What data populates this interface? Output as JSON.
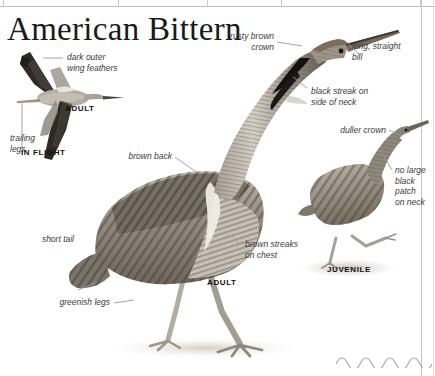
{
  "page": {
    "title": "American Bittern"
  },
  "figures": {
    "in_flight": {
      "caption_age": "ADULT",
      "caption_mode": "IN FLIGHT"
    },
    "adult": {
      "caption": "ADULT"
    },
    "juvenile": {
      "caption": "JUVENILE"
    }
  },
  "annotations": {
    "dark_outer_wing_feathers": "dark outer\nwing feathers",
    "trailing_legs": "trailing\nlegs",
    "rusty_brown_crown": "rusty brown\ncrown",
    "long_straight_bill": "long, straight\nbill",
    "black_streak_on_side_of_neck": "black streak on\nside of neck",
    "duller_crown": "duller crown",
    "no_large_black_patch_on_neck": "no large\nblack\npatch\non neck",
    "brown_back": "brown back",
    "short_tail": "short tail",
    "greenish_legs": "greenish legs",
    "brown_streaks_on_chest": "brown streaks\non chest"
  },
  "colors": {
    "ink": "#1a1a1a",
    "label": "#3b3b3b",
    "leader": "#9a9a9a",
    "rule": "#bdbdbd",
    "plumage_dark": "#3a342e",
    "plumage_mid": "#8d867c",
    "plumage_light": "#cfc9c0",
    "background": "#ffffff"
  }
}
